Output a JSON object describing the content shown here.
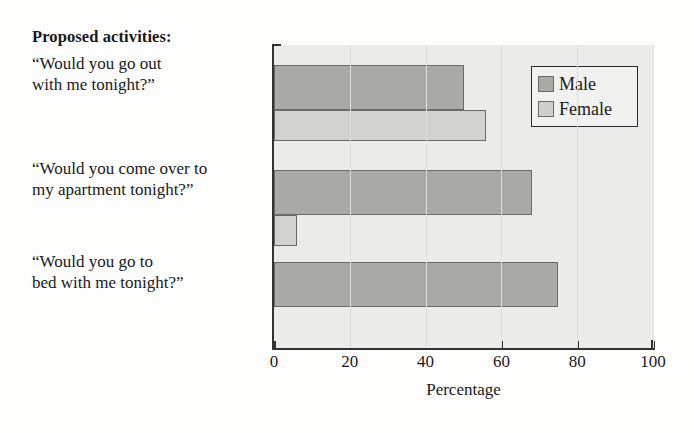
{
  "figure": {
    "title": "Proposed activities:",
    "xlabel": "Percentage"
  },
  "legend": {
    "entries": [
      {
        "label": "Male",
        "color": "#a9a9a7"
      },
      {
        "label": "Female",
        "color": "#cfcfcd"
      }
    ]
  },
  "axis": {
    "ticks": [
      "0",
      "20",
      "40",
      "60",
      "80",
      "100"
    ]
  },
  "categories": [
    {
      "line1": "“Would you go out",
      "line2": "with me tonight?”"
    },
    {
      "line1": "“Would you come over to",
      "line2": "my apartment tonight?”"
    },
    {
      "line1": "“Would you go to",
      "line2": "bed with me tonight?”"
    }
  ],
  "chart_data": {
    "type": "bar",
    "orientation": "horizontal",
    "title": "Proposed activities:",
    "xlabel": "Percentage",
    "ylabel": "",
    "xlim": [
      0,
      100
    ],
    "xticks": [
      0,
      20,
      40,
      60,
      80,
      100
    ],
    "grid": true,
    "legend_position": "top-right",
    "categories": [
      "“Would you go out with me tonight?”",
      "“Would you come over to my apartment tonight?”",
      "“Would you go to bed with me tonight?”"
    ],
    "series": [
      {
        "name": "Male",
        "color": "#a9a9a7",
        "values": [
          50,
          68,
          75
        ]
      },
      {
        "name": "Female",
        "color": "#cfcfcd",
        "values": [
          56,
          6,
          0
        ]
      }
    ]
  }
}
